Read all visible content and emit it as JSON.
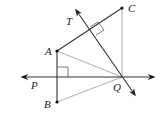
{
  "diagram": {
    "type": "geometry",
    "labels": {
      "A": "A",
      "B": "B",
      "C": "C",
      "P": "P",
      "Q": "Q",
      "T": "T"
    },
    "points": {
      "A": [
        57,
        51
      ],
      "B": [
        57,
        102
      ],
      "C": [
        122,
        8
      ],
      "Q": [
        122,
        77
      ]
    },
    "lines": [
      {
        "name": "line-PQ",
        "from": [
          20,
          77
        ],
        "to": [
          155,
          77
        ],
        "arrows": "both"
      },
      {
        "name": "ray-QT",
        "from": [
          136,
          96
        ],
        "to": [
          75,
          9
        ],
        "arrows": "both"
      }
    ],
    "segments": [
      {
        "name": "segment-AC",
        "from": "A",
        "to": "C",
        "style": "thick"
      },
      {
        "name": "segment-AB",
        "from": "A",
        "to": "B",
        "style": "thick"
      },
      {
        "name": "segment-AQ",
        "from": "A",
        "to": "Q",
        "style": "thin"
      },
      {
        "name": "segment-BQ",
        "from": "B",
        "to": "Q",
        "style": "thin"
      },
      {
        "name": "segment-CQ",
        "from": "C",
        "to": "Q",
        "style": "thin"
      }
    ],
    "right_angles": [
      {
        "name": "right-angle-AB-PQ",
        "at": [
          57,
          77
        ]
      },
      {
        "name": "right-angle-QT-AC",
        "at": [
          92,
          30
        ]
      }
    ]
  }
}
